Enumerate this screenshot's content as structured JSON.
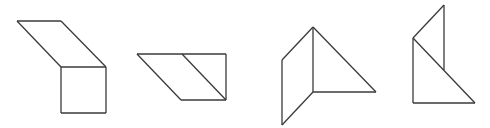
{
  "diagram": {
    "canvas": {
      "width": 490,
      "height": 128,
      "background": "#ffffff",
      "stroke": "#3a3a3a"
    },
    "figures": [
      {
        "id": "figure-1",
        "description": "parallelogram above a square",
        "segments": [
          [
            17,
            21,
            61,
            21
          ],
          [
            17,
            21,
            61,
            67
          ],
          [
            61,
            21,
            106,
            67
          ],
          [
            61,
            67,
            106,
            67
          ],
          [
            61,
            67,
            61,
            113
          ],
          [
            106,
            67,
            106,
            113
          ],
          [
            61,
            113,
            106,
            113
          ]
        ]
      },
      {
        "id": "figure-2",
        "description": "parallelogram joined with right triangle",
        "segments": [
          [
            137,
            54,
            226,
            54
          ],
          [
            137,
            54,
            181,
            100
          ],
          [
            182,
            54,
            226,
            100
          ],
          [
            226,
            54,
            226,
            100
          ],
          [
            181,
            100,
            226,
            100
          ]
        ]
      },
      {
        "id": "figure-3",
        "description": "right triangle with attached parallelogram on left",
        "segments": [
          [
            313,
            27,
            313,
            92
          ],
          [
            313,
            27,
            376,
            92
          ],
          [
            313,
            92,
            376,
            92
          ],
          [
            282,
            60,
            313,
            27
          ],
          [
            282,
            60,
            282,
            125
          ],
          [
            282,
            125,
            313,
            92
          ]
        ]
      },
      {
        "id": "figure-4",
        "description": "stacked triangles",
        "segments": [
          [
            444,
            5,
            444,
            70
          ],
          [
            444,
            5,
            413,
            38
          ],
          [
            413,
            38,
            413,
            103
          ],
          [
            413,
            38,
            475,
            103
          ],
          [
            413,
            103,
            475,
            103
          ]
        ]
      }
    ]
  }
}
